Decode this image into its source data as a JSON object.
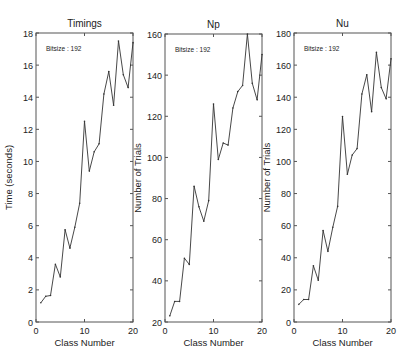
{
  "figure": {
    "background": "#ffffff",
    "line_color": "#333333",
    "axis_color": "#555555"
  },
  "chart_data": [
    {
      "type": "line",
      "title": "Timings",
      "xlabel": "Class Number",
      "ylabel": "Time (seconds)",
      "annotation": "Bitsize : 192",
      "xlim": [
        0,
        20
      ],
      "ylim": [
        0,
        18
      ],
      "xticks": [
        0,
        10,
        20
      ],
      "yticks": [
        0,
        2,
        4,
        6,
        8,
        10,
        12,
        14,
        16,
        18
      ],
      "grid": false,
      "x": [
        1,
        2,
        3,
        4,
        5,
        6,
        7,
        8,
        9,
        10,
        11,
        12,
        13,
        14,
        15,
        16,
        17,
        18,
        19,
        20
      ],
      "values": [
        1.2,
        1.6,
        1.65,
        3.6,
        2.8,
        5.75,
        4.6,
        5.9,
        7.4,
        12.5,
        9.4,
        10.6,
        11.1,
        14.2,
        15.6,
        13.5,
        17.5,
        15.4,
        14.6,
        17.4
      ],
      "box": {
        "left": 36,
        "top": 33,
        "right": 133,
        "bottom": 322
      }
    },
    {
      "type": "line",
      "title": "Np",
      "xlabel": "Class Number",
      "ylabel": "Number of Trials",
      "annotation": "Bitsize : 192",
      "xlim": [
        0,
        20
      ],
      "ylim": [
        20,
        160
      ],
      "xticks": [
        0,
        10,
        20
      ],
      "yticks": [
        20,
        40,
        60,
        80,
        100,
        120,
        140,
        160
      ],
      "grid": false,
      "x": [
        1,
        2,
        3,
        4,
        5,
        6,
        7,
        8,
        9,
        10,
        11,
        12,
        13,
        14,
        15,
        16,
        17,
        18,
        19,
        20
      ],
      "values": [
        23,
        30,
        30,
        51,
        48,
        86,
        76,
        69,
        79,
        126,
        99,
        107,
        106,
        124,
        132,
        135,
        160,
        136,
        128,
        150
      ],
      "box": {
        "left": 165,
        "top": 34,
        "right": 262,
        "bottom": 322
      }
    },
    {
      "type": "line",
      "title": "Nu",
      "xlabel": "Class Number",
      "ylabel": "Number of Trials",
      "annotation": "Bitsize : 192",
      "xlim": [
        0,
        20
      ],
      "ylim": [
        0,
        180
      ],
      "xticks": [
        0,
        10,
        20
      ],
      "yticks": [
        0,
        20,
        40,
        60,
        80,
        100,
        120,
        140,
        160,
        180
      ],
      "grid": false,
      "x": [
        1,
        2,
        3,
        4,
        5,
        6,
        7,
        8,
        9,
        10,
        11,
        12,
        13,
        14,
        15,
        16,
        17,
        18,
        19,
        20
      ],
      "values": [
        11,
        14,
        14,
        35,
        26,
        57,
        44,
        59,
        72,
        128,
        92,
        104,
        108,
        142,
        154,
        131,
        168,
        146,
        139,
        164
      ],
      "box": {
        "left": 294,
        "top": 33,
        "right": 391,
        "bottom": 322
      }
    }
  ]
}
